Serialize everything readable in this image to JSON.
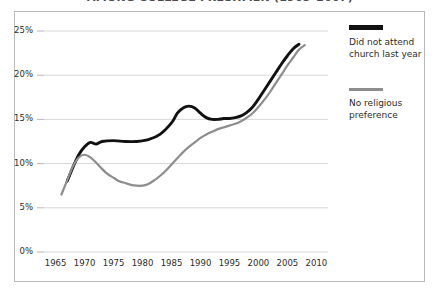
{
  "chart_data": {
    "type": "line",
    "title": "AMONG COLLEGE FRESHMEN (1965–2007)",
    "xlabel": "",
    "ylabel": "",
    "xlim": [
      1963,
      2012
    ],
    "ylim": [
      0,
      25
    ],
    "grid": true,
    "legend_position": "right",
    "xticks": [
      "1965",
      "1970",
      "1975",
      "1980",
      "1985",
      "1990",
      "1995",
      "2000",
      "2005",
      "2010"
    ],
    "yticks": [
      "0%",
      "5%",
      "10%",
      "15%",
      "20%",
      "25%"
    ],
    "series": [
      {
        "name": "Did not attend church last year",
        "color": "#111111",
        "points": [
          [
            1967.0,
            8.0
          ],
          [
            1968.0,
            9.6
          ],
          [
            1969.0,
            11.0
          ],
          [
            1970.0,
            11.9
          ],
          [
            1971.0,
            12.4
          ],
          [
            1972.0,
            12.2
          ],
          [
            1973.0,
            12.5
          ],
          [
            1975.0,
            12.6
          ],
          [
            1977.0,
            12.5
          ],
          [
            1979.0,
            12.5
          ],
          [
            1981.0,
            12.7
          ],
          [
            1983.0,
            13.3
          ],
          [
            1985.0,
            14.6
          ],
          [
            1986.0,
            15.7
          ],
          [
            1987.0,
            16.3
          ],
          [
            1988.0,
            16.5
          ],
          [
            1989.0,
            16.3
          ],
          [
            1990.0,
            15.7
          ],
          [
            1991.0,
            15.2
          ],
          [
            1992.0,
            15.0
          ],
          [
            1993.0,
            15.0
          ],
          [
            1994.0,
            15.1
          ],
          [
            1995.0,
            15.1
          ],
          [
            1996.0,
            15.2
          ],
          [
            1997.0,
            15.4
          ],
          [
            1998.0,
            15.8
          ],
          [
            1999.0,
            16.4
          ],
          [
            2000.0,
            17.3
          ],
          [
            2001.0,
            18.3
          ],
          [
            2002.0,
            19.3
          ],
          [
            2003.0,
            20.3
          ],
          [
            2004.0,
            21.3
          ],
          [
            2005.0,
            22.2
          ],
          [
            2006.0,
            23.0
          ],
          [
            2007.0,
            23.5
          ]
        ]
      },
      {
        "name": "No religious preference",
        "color": "#8d8d8d",
        "points": [
          [
            1966.0,
            6.5
          ],
          [
            1967.0,
            8.1
          ],
          [
            1968.0,
            9.7
          ],
          [
            1969.0,
            10.7
          ],
          [
            1970.0,
            11.0
          ],
          [
            1971.0,
            10.7
          ],
          [
            1972.0,
            10.1
          ],
          [
            1973.0,
            9.4
          ],
          [
            1974.0,
            8.8
          ],
          [
            1975.0,
            8.4
          ],
          [
            1976.0,
            8.0
          ],
          [
            1977.0,
            7.8
          ],
          [
            1978.0,
            7.6
          ],
          [
            1979.0,
            7.5
          ],
          [
            1980.0,
            7.5
          ],
          [
            1981.0,
            7.7
          ],
          [
            1982.0,
            8.1
          ],
          [
            1983.0,
            8.6
          ],
          [
            1984.0,
            9.2
          ],
          [
            1985.0,
            9.9
          ],
          [
            1986.0,
            10.6
          ],
          [
            1987.0,
            11.3
          ],
          [
            1988.0,
            11.9
          ],
          [
            1989.0,
            12.4
          ],
          [
            1990.0,
            12.9
          ],
          [
            1991.0,
            13.3
          ],
          [
            1992.0,
            13.6
          ],
          [
            1993.0,
            13.9
          ],
          [
            1994.0,
            14.1
          ],
          [
            1995.0,
            14.3
          ],
          [
            1996.0,
            14.5
          ],
          [
            1997.0,
            14.8
          ],
          [
            1998.0,
            15.2
          ],
          [
            1999.0,
            15.7
          ],
          [
            2000.0,
            16.4
          ],
          [
            2001.0,
            17.2
          ],
          [
            2002.0,
            18.1
          ],
          [
            2003.0,
            19.1
          ],
          [
            2004.0,
            20.1
          ],
          [
            2005.0,
            21.1
          ],
          [
            2006.0,
            22.0
          ],
          [
            2007.0,
            22.9
          ],
          [
            2008.0,
            23.4
          ]
        ]
      }
    ]
  },
  "legend": [
    {
      "label": "Did not attend\nchurch last  year",
      "swatch": "thick-black"
    },
    {
      "label": "No religious\npreference",
      "swatch": "gray"
    }
  ],
  "axis": {
    "y_labels": [
      "25%",
      "20%",
      "15%",
      "10%",
      "5%",
      "0%"
    ],
    "x_labels": [
      "1965",
      "1970",
      "1975",
      "1980",
      "1985",
      "1990",
      "1995",
      "2000",
      "2005",
      "2010"
    ]
  }
}
